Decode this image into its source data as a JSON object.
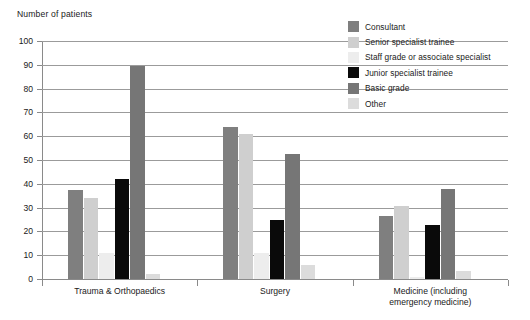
{
  "chart_data": {
    "type": "bar",
    "title": "Number of patients",
    "xlabel": "",
    "ylabel": "Number of patients",
    "ylim": [
      0,
      100
    ],
    "ytick_step": 10,
    "yticks": [
      "100",
      "90",
      "80",
      "70",
      "60",
      "50",
      "40",
      "30",
      "20",
      "10",
      "0"
    ],
    "grid": true,
    "legend_position": "top-right",
    "categories": [
      "Trauma & Orthopaedics",
      "Surgery",
      "Medicine (including\nemergency medicine)"
    ],
    "series": [
      {
        "name": "Consultant",
        "color": "#7f7f7f",
        "values": [
          37.5,
          64,
          26.5
        ]
      },
      {
        "name": "Senior specialist trainee",
        "color": "#cfcfcf",
        "values": [
          34,
          61,
          30.5
        ]
      },
      {
        "name": "Staff grade or associate specialist",
        "color": "#ededed",
        "values": [
          11,
          11,
          1
        ]
      },
      {
        "name": "Junior specialist trainee",
        "color": "#0a0a0a",
        "values": [
          42,
          25,
          22.5
        ]
      },
      {
        "name": "Basic grade",
        "color": "#767676",
        "values": [
          89.5,
          52.5,
          38
        ]
      },
      {
        "name": "Other",
        "color": "#dcdcdc",
        "values": [
          2,
          6,
          3.5
        ]
      }
    ]
  },
  "legend": {
    "items": [
      {
        "label": "Consultant"
      },
      {
        "label": "Senior specialist trainee"
      },
      {
        "label": "Staff grade or associate specialist"
      },
      {
        "label": "Junior specialist trainee"
      },
      {
        "label": "Basic grade"
      },
      {
        "label": "Other"
      }
    ]
  }
}
